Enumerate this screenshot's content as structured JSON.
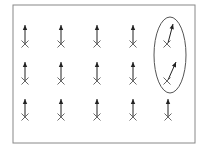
{
  "diagram": {
    "frame": {
      "x": 13,
      "y": 5,
      "width": 182,
      "height": 138,
      "stroke": "#888888"
    },
    "columns_x": [
      25,
      61,
      97,
      133,
      168
    ],
    "rows": [
      {
        "marker_y": 44,
        "arrow_tip_y": 25
      },
      {
        "marker_y": 81,
        "arrow_tip_y": 62
      },
      {
        "marker_y": 117,
        "arrow_tip_y": 99
      }
    ],
    "deflected_arrows": [
      {
        "col": 4,
        "row": 0,
        "from": [
          168,
          43
        ],
        "to": [
          173,
          24
        ]
      },
      {
        "col": 4,
        "row": 1,
        "from": [
          168,
          80
        ],
        "to": [
          176,
          62
        ]
      }
    ],
    "highlight_ellipse": {
      "cx": 170,
      "cy": 55,
      "rx": 16,
      "ry": 38,
      "stroke": "#555555"
    },
    "colors": {
      "arrow": "#222222",
      "marker": "#666666",
      "frame": "#888888"
    }
  }
}
